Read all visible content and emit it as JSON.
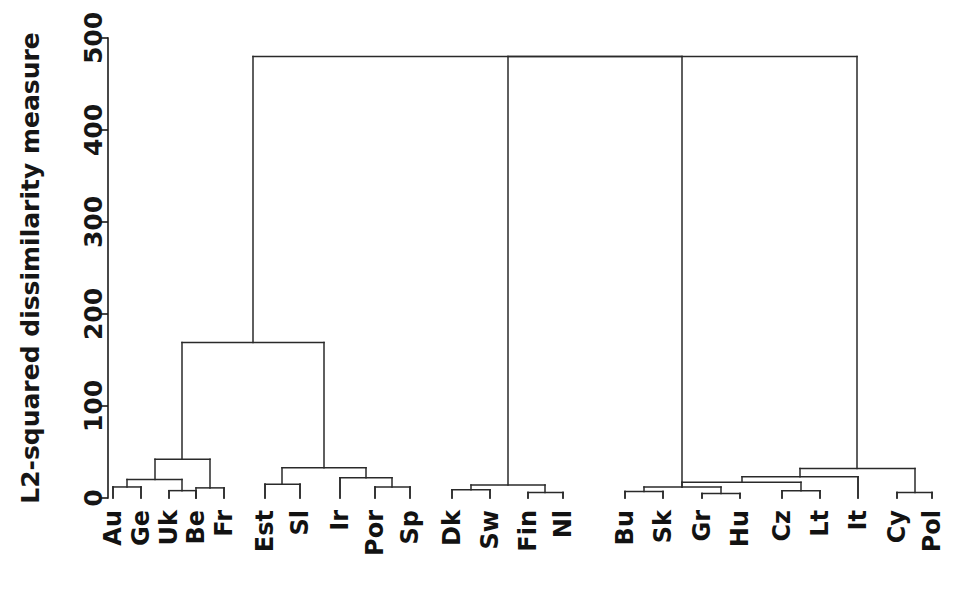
{
  "figure": {
    "kind": "dendrogram",
    "background_color": "#ffffff",
    "line_color": "#2a2a2a",
    "text_color": "#161616"
  },
  "chart_data": {
    "type": "dendrogram",
    "title": "",
    "subtitle": "",
    "xlabel": "",
    "ylabel": "L2-squared dissimilarity measure",
    "ylim": [
      0,
      500
    ],
    "yticks": [
      0,
      100,
      200,
      300,
      400,
      500
    ],
    "ytick_labels": [
      "0",
      "100",
      "200",
      "300",
      "400",
      "500"
    ],
    "grid": false,
    "legend": null,
    "orientation": "vertical",
    "leaf_order": [
      "Au",
      "Ge",
      "Uk",
      "Be",
      "Fr",
      "Est",
      "Sl",
      "Ir",
      "Por",
      "Sp",
      "Dk",
      "Sw",
      "Fin",
      "Nl",
      "Bu",
      "Sk",
      "Gr",
      "Hu",
      "Cz",
      "Lt",
      "It",
      "Cy",
      "Pol"
    ],
    "leaf_count": 23,
    "merges": [
      {
        "id": "m1",
        "left": "Au",
        "right": "Ge",
        "height": 12
      },
      {
        "id": "m2",
        "left": "Uk",
        "right": "Be",
        "height": 8
      },
      {
        "id": "m3",
        "left": "m1",
        "right": "m2",
        "height": 18
      },
      {
        "id": "m4",
        "left": "Fr",
        "right": "Sp",
        "height": 11
      },
      {
        "id": "m5",
        "left": "m3",
        "right": "m4",
        "height": 42
      },
      {
        "id": "m6",
        "left": "Est",
        "right": "Sl",
        "height": 15
      },
      {
        "id": "m7",
        "left": "Por",
        "right": "Sp2",
        "height": 12
      },
      {
        "id": "m8",
        "left": "Ir",
        "right": "m7",
        "height": 20
      },
      {
        "id": "m9",
        "left": "m6",
        "right": "m8",
        "height": 28
      },
      {
        "id": "m10",
        "left": "m5",
        "right": "m9",
        "height": 169
      },
      {
        "id": "m11",
        "left": "Dk",
        "right": "Sw",
        "height": 9
      },
      {
        "id": "m12",
        "left": "Fin",
        "right": "Nl",
        "height": 6
      },
      {
        "id": "m13",
        "left": "m11",
        "right": "m12",
        "height": 13
      },
      {
        "id": "m14",
        "left": "Bu",
        "right": "Sk",
        "height": 7
      },
      {
        "id": "m15",
        "left": "Gr",
        "right": "Hu",
        "height": 5
      },
      {
        "id": "m16",
        "left": "m14",
        "right": "m15",
        "height": 11
      },
      {
        "id": "m17",
        "left": "Cz",
        "right": "Lt",
        "height": 8
      },
      {
        "id": "m18",
        "left": "m16",
        "right": "m17",
        "height": 16
      },
      {
        "id": "m19",
        "left": "m18",
        "right": "It",
        "height": 22
      },
      {
        "id": "m20",
        "left": "Cy",
        "right": "Pol",
        "height": 6
      },
      {
        "id": "m21",
        "left": "m19",
        "right": "m20",
        "height": 31
      },
      {
        "id": "m22",
        "left": "m13",
        "right": "m21",
        "height": 480
      },
      {
        "id": "root",
        "left": "m10",
        "right": "m22",
        "height": 480
      }
    ],
    "nodes": [
      {
        "name": "leaf-Au",
        "x": 113,
        "h": 0
      },
      {
        "name": "leaf-Ge",
        "x": 141,
        "h": 0
      },
      {
        "name": "leaf-Uk",
        "x": 169,
        "h": 0
      },
      {
        "name": "leaf-Be",
        "x": 196,
        "h": 0
      },
      {
        "name": "leaf-Fr",
        "x": 224,
        "h": 0
      },
      {
        "name": "leaf-Est",
        "x": 265,
        "h": 0
      },
      {
        "name": "leaf-Sl",
        "x": 300,
        "h": 0
      },
      {
        "name": "leaf-Ir",
        "x": 340,
        "h": 0
      },
      {
        "name": "leaf-Por",
        "x": 375,
        "h": 0
      },
      {
        "name": "leaf-Sp",
        "x": 410,
        "h": 0
      },
      {
        "name": "leaf-Dk",
        "x": 452,
        "h": 0
      },
      {
        "name": "leaf-Sw",
        "x": 490,
        "h": 0
      },
      {
        "name": "leaf-Fin",
        "x": 528,
        "h": 0
      },
      {
        "name": "leaf-Nl",
        "x": 563,
        "h": 0
      },
      {
        "name": "leaf-Bu",
        "x": 625,
        "h": 0
      },
      {
        "name": "leaf-Sk",
        "x": 663,
        "h": 0
      },
      {
        "name": "leaf-Gr",
        "x": 702,
        "h": 0
      },
      {
        "name": "leaf-Hu",
        "x": 740,
        "h": 0
      },
      {
        "name": "leaf-Cz",
        "x": 782,
        "h": 0
      },
      {
        "name": "leaf-Lt",
        "x": 820,
        "h": 0
      },
      {
        "name": "leaf-It",
        "x": 858,
        "h": 0
      },
      {
        "name": "leaf-Cy",
        "x": 897,
        "h": 0
      },
      {
        "name": "leaf-Pol",
        "x": 932,
        "h": 0
      }
    ],
    "links": [
      {
        "name": "link-au-ge",
        "x1": 113,
        "x2": 141,
        "h": 12
      },
      {
        "name": "link-uk-be",
        "x1": 169,
        "x2": 196,
        "h": 8
      },
      {
        "name": "link-auge-ukbe",
        "x1": 127,
        "x2": 182,
        "h": 20
      },
      {
        "name": "link-be-fr",
        "x1": 196,
        "x2": 224,
        "h": 11
      },
      {
        "name": "link-west-core",
        "x1": 155,
        "x2": 210,
        "h": 42
      },
      {
        "name": "link-est-sl",
        "x1": 265,
        "x2": 300,
        "h": 15
      },
      {
        "name": "link-por-sp",
        "x1": 375,
        "x2": 410,
        "h": 12
      },
      {
        "name": "link-ir-porsp",
        "x1": 340,
        "x2": 392,
        "h": 22
      },
      {
        "name": "link-estsl-irpor",
        "x1": 282,
        "x2": 366,
        "h": 33
      },
      {
        "name": "link-west-south",
        "x1": 182,
        "x2": 324,
        "h": 169
      },
      {
        "name": "link-dk-sw",
        "x1": 452,
        "x2": 490,
        "h": 9
      },
      {
        "name": "link-fin-nl",
        "x1": 528,
        "x2": 563,
        "h": 6
      },
      {
        "name": "link-nordic",
        "x1": 471,
        "x2": 545,
        "h": 14
      },
      {
        "name": "link-bu-sk",
        "x1": 625,
        "x2": 663,
        "h": 7
      },
      {
        "name": "link-gr-hu",
        "x1": 702,
        "x2": 740,
        "h": 5
      },
      {
        "name": "link-balkan",
        "x1": 644,
        "x2": 721,
        "h": 12
      },
      {
        "name": "link-cz-lt",
        "x1": 782,
        "x2": 820,
        "h": 8
      },
      {
        "name": "link-balkan-cz",
        "x1": 682,
        "x2": 801,
        "h": 17
      },
      {
        "name": "link-east-it",
        "x1": 742,
        "x2": 858,
        "h": 23
      },
      {
        "name": "link-cy-pol",
        "x1": 897,
        "x2": 932,
        "h": 6
      },
      {
        "name": "link-east-cy",
        "x1": 800,
        "x2": 915,
        "h": 32
      },
      {
        "name": "link-nordic-east",
        "x1": 508,
        "x2": 857,
        "h": 480
      },
      {
        "name": "link-root",
        "x1": 253,
        "x2": 682,
        "h": 480
      }
    ],
    "root_height": 480
  },
  "geometry": {
    "plot_left": 108,
    "plot_bottom_y": 498,
    "plot_top_y": 38,
    "axis_tick_length": 9,
    "label_offset": 12
  }
}
